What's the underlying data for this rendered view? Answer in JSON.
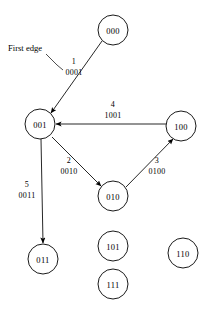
{
  "figure": {
    "annotation": {
      "first_edge_label": "First edge"
    },
    "nodes": [
      {
        "id": "000",
        "label": "000",
        "cx": 113,
        "cy": 30,
        "r": 15
      },
      {
        "id": "001",
        "label": "001",
        "cx": 40,
        "cy": 124,
        "r": 15
      },
      {
        "id": "100",
        "label": "100",
        "cx": 181,
        "cy": 126,
        "r": 15
      },
      {
        "id": "010",
        "label": "010",
        "cx": 113,
        "cy": 196,
        "r": 15
      },
      {
        "id": "101",
        "label": "101",
        "cx": 113,
        "cy": 246,
        "r": 15
      },
      {
        "id": "111",
        "label": "111",
        "cx": 113,
        "cy": 284,
        "r": 15
      },
      {
        "id": "011",
        "label": "011",
        "cx": 43,
        "cy": 259,
        "r": 15
      },
      {
        "id": "110",
        "label": "110",
        "cx": 183,
        "cy": 253,
        "r": 15
      }
    ],
    "edges": [
      {
        "id": "e1",
        "from": "000",
        "to": "001",
        "order": "1",
        "code": "0001",
        "x1": 102,
        "y1": 41,
        "x2": 51,
        "y2": 113,
        "order_x": 74,
        "order_y": 64,
        "code_x": 74,
        "code_y": 75
      },
      {
        "id": "e4",
        "from": "100",
        "to": "001",
        "order": "4",
        "code": "1001",
        "x1": 166,
        "y1": 124,
        "x2": 56,
        "y2": 124,
        "order_x": 113,
        "order_y": 107,
        "code_x": 113,
        "code_y": 118
      },
      {
        "id": "e2",
        "from": "001",
        "to": "010",
        "order": "2",
        "code": "0010",
        "x1": 52,
        "y1": 137,
        "x2": 101,
        "y2": 186,
        "order_x": 69,
        "order_y": 163,
        "code_x": 69,
        "code_y": 174
      },
      {
        "id": "e3",
        "from": "010",
        "to": "100",
        "order": "3",
        "code": "0100",
        "x1": 126,
        "y1": 187,
        "x2": 173,
        "y2": 139,
        "order_x": 157,
        "order_y": 163,
        "code_x": 157,
        "code_y": 174
      },
      {
        "id": "e5",
        "from": "001",
        "to": "011",
        "order": "5",
        "code": "0011",
        "x1": 41,
        "y1": 139,
        "x2": 43,
        "y2": 243,
        "order_x": 27,
        "order_y": 187,
        "code_x": 27,
        "code_y": 198
      }
    ],
    "colors": {
      "stroke": "#000000",
      "node_fill": "#ffffff",
      "background": "#ffffff"
    }
  }
}
